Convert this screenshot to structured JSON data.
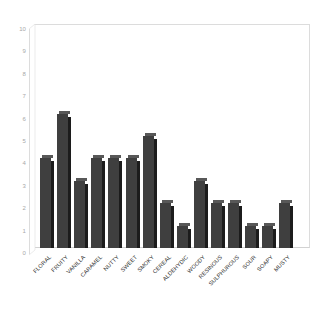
{
  "chart_data": {
    "type": "bar",
    "title": "",
    "subtitle": "",
    "xlabel": "",
    "ylabel": "",
    "ylim": [
      0,
      10
    ],
    "ytick_labels": [
      "10",
      "9",
      "8",
      "7",
      "6",
      "5",
      "4",
      "3",
      "2",
      "1",
      "0"
    ],
    "yticks": [
      10,
      9,
      8,
      7,
      6,
      5,
      4,
      3,
      2,
      1,
      0
    ],
    "grid": false,
    "legend": false,
    "legend_position": "none",
    "bar_color": "#3f3f3f",
    "bar_side_color": "#1c1c1c",
    "bar_top_color": "#585858",
    "axis_color": "#dcdcdc",
    "tick_label_color": "#a8a8a8",
    "category_label_color": "#2b2b2b",
    "category_label_rotation": -45,
    "categories": [
      "FLORAL",
      "FRUITY",
      "VANILLA",
      "CARAMEL",
      "NUTTY",
      "SWEET",
      "SMOKY",
      "CEREAL",
      "ALDEHYDIC",
      "WOODY",
      "RESINOUS",
      "SULPHUROUS",
      "SOUR",
      "SOAPY",
      "MUSTY"
    ],
    "values": [
      4,
      6,
      3,
      4,
      4,
      4,
      5,
      2,
      1,
      3,
      2,
      2,
      1,
      1,
      2
    ]
  }
}
